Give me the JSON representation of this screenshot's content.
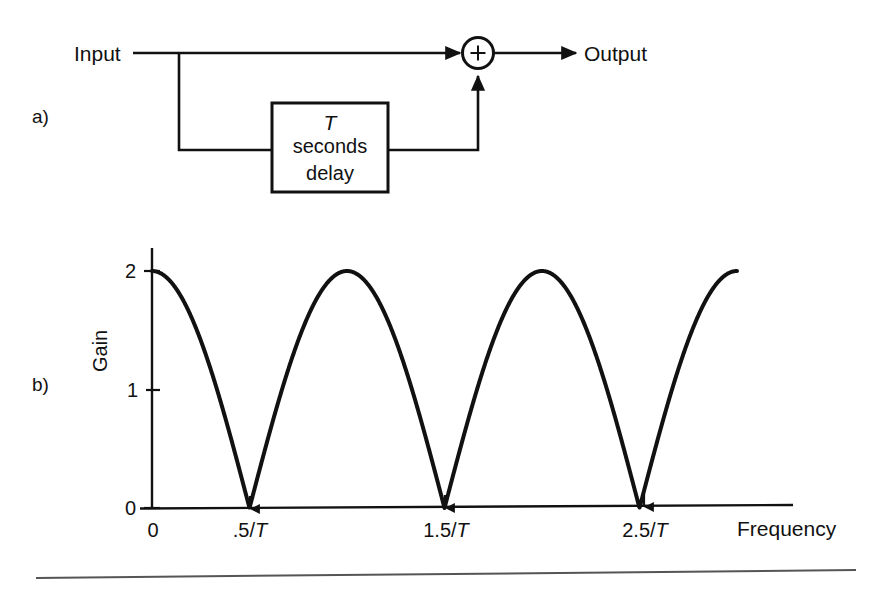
{
  "figure": {
    "panel_a_label": "a)",
    "panel_b_label": "b)",
    "background_color": "#ffffff",
    "ink_color": "#111111"
  },
  "block_diagram": {
    "input_label": "Input",
    "output_label": "Output",
    "summing_junction_symbol": "+",
    "delay_block": {
      "line1": "T",
      "line2": "seconds",
      "line3": "delay"
    }
  },
  "chart_data": {
    "type": "line",
    "title": "",
    "xlabel": "Frequency",
    "ylabel": "Gain",
    "grid": false,
    "legend": "none",
    "xlim": [
      0,
      3.2
    ],
    "ylim": [
      0,
      2.15
    ],
    "xtick_labels": [
      "0",
      ".5/T",
      "1.5/T",
      "2.5/T"
    ],
    "xtick_values": [
      0,
      0.5,
      1.5,
      2.5
    ],
    "ytick_labels": [
      "0",
      "1",
      "2"
    ],
    "ytick_values": [
      0,
      1,
      2
    ],
    "axis_label_suffix": "/T",
    "series": [
      {
        "name": "Comb filter gain |2 cos(pi f T)|",
        "x": [
          0,
          0.1,
          0.2,
          0.3,
          0.4,
          0.5,
          0.6,
          0.7,
          0.8,
          0.9,
          1.0,
          1.1,
          1.2,
          1.3,
          1.4,
          1.5,
          1.6,
          1.7,
          1.8,
          1.9,
          2.0,
          2.1,
          2.2,
          2.3,
          2.4,
          2.5,
          2.6,
          2.7,
          2.8,
          2.9,
          3.0
        ],
        "y": [
          2.0,
          1.9,
          1.62,
          1.18,
          0.62,
          0.0,
          0.62,
          1.18,
          1.62,
          1.9,
          2.0,
          1.9,
          1.62,
          1.18,
          0.62,
          0.0,
          0.62,
          1.18,
          1.62,
          1.9,
          2.0,
          1.9,
          1.62,
          1.18,
          0.62,
          0.0,
          0.62,
          1.18,
          1.62,
          1.9,
          2.0
        ]
      }
    ],
    "nulls_at": [
      0.5,
      1.5,
      2.5
    ],
    "peaks_at": [
      0,
      1.0,
      2.0,
      3.0
    ],
    "peak_value": 2
  }
}
